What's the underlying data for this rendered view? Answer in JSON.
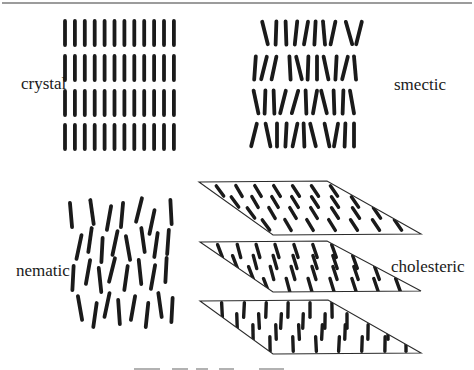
{
  "page": {
    "background": "#ffffff",
    "top_rule_color": "#9c9c9c"
  },
  "labels": {
    "crystal": "crystal",
    "smectic": "smectic",
    "nematic": "nematic",
    "cholesteric": "cholesteric"
  },
  "diagram": {
    "rod_color": "#1a1a1a",
    "plane_stroke_color": "#2b2b2b",
    "crystal": {
      "cols": 12,
      "x_start": 65,
      "x_step": 9.9,
      "row_centers": [
        33,
        68,
        103,
        137
      ],
      "rod_length": 28,
      "rod_width": 3.8
    },
    "smectic": {
      "rod_length": 27,
      "rod_width": 3.8,
      "rods": [
        [
          265,
          33,
          -14
        ],
        [
          276,
          33,
          2
        ],
        [
          286,
          33,
          -2
        ],
        [
          296,
          33,
          6
        ],
        [
          306,
          33,
          10
        ],
        [
          315,
          33,
          3
        ],
        [
          324,
          33,
          -5
        ],
        [
          333,
          33,
          12
        ],
        [
          349,
          33,
          -16
        ],
        [
          359,
          33,
          14
        ],
        [
          255,
          68,
          4
        ],
        [
          264,
          68,
          14
        ],
        [
          274,
          68,
          12
        ],
        [
          290,
          68,
          -3
        ],
        [
          299,
          68,
          -14
        ],
        [
          308,
          68,
          2
        ],
        [
          317,
          68,
          0
        ],
        [
          326,
          68,
          -12
        ],
        [
          336,
          68,
          3
        ],
        [
          345,
          68,
          14
        ],
        [
          355,
          68,
          -5
        ],
        [
          256,
          102,
          -12
        ],
        [
          265,
          102,
          2
        ],
        [
          274,
          102,
          -2
        ],
        [
          283,
          102,
          14
        ],
        [
          295,
          102,
          16
        ],
        [
          306,
          102,
          -2
        ],
        [
          315,
          102,
          10
        ],
        [
          324,
          102,
          -14
        ],
        [
          334,
          102,
          -2
        ],
        [
          343,
          102,
          2
        ],
        [
          352,
          102,
          -10
        ],
        [
          254,
          135,
          14
        ],
        [
          268,
          135,
          -12
        ],
        [
          277,
          135,
          0
        ],
        [
          286,
          135,
          3
        ],
        [
          295,
          135,
          12
        ],
        [
          304,
          135,
          -2
        ],
        [
          313,
          135,
          -14
        ],
        [
          327,
          135,
          -12
        ],
        [
          336,
          135,
          10
        ],
        [
          345,
          135,
          2
        ],
        [
          354,
          135,
          0
        ]
      ]
    },
    "nematic": {
      "rod_length": 28,
      "rod_width": 3.8,
      "rods": [
        [
          71,
          215,
          -5
        ],
        [
          92,
          212,
          -8
        ],
        [
          109,
          218,
          10
        ],
        [
          122,
          215,
          5
        ],
        [
          139,
          210,
          14
        ],
        [
          152,
          222,
          12
        ],
        [
          171,
          212,
          -3
        ],
        [
          79,
          247,
          12
        ],
        [
          90,
          240,
          8
        ],
        [
          102,
          250,
          3
        ],
        [
          115,
          243,
          12
        ],
        [
          128,
          248,
          -10
        ],
        [
          143,
          240,
          -8
        ],
        [
          156,
          245,
          8
        ],
        [
          168,
          242,
          4
        ],
        [
          73,
          278,
          3
        ],
        [
          88,
          272,
          10
        ],
        [
          100,
          280,
          -6
        ],
        [
          112,
          270,
          14
        ],
        [
          126,
          278,
          8
        ],
        [
          140,
          272,
          -6
        ],
        [
          153,
          277,
          10
        ],
        [
          166,
          270,
          3
        ],
        [
          80,
          308,
          -10
        ],
        [
          95,
          315,
          8
        ],
        [
          107,
          305,
          12
        ],
        [
          119,
          312,
          -4
        ],
        [
          133,
          308,
          10
        ],
        [
          147,
          315,
          6
        ],
        [
          160,
          305,
          -8
        ],
        [
          172,
          310,
          3
        ]
      ]
    },
    "cholesteric": {
      "rod_width": 3.4,
      "planes": [
        {
          "angle": -33,
          "rod_length": 16,
          "polygon": [
            [
              199,
              182
            ],
            [
              327,
              181
            ],
            [
              421,
              234
            ],
            [
              273,
              235
            ]
          ],
          "rods": [
            [
              220,
              191
            ],
            [
              239,
              191
            ],
            [
              258,
              191
            ],
            [
              277,
              191
            ],
            [
              296,
              191
            ],
            [
              315,
              191
            ],
            [
              334,
              191
            ],
            [
              235,
              202
            ],
            [
              255,
              202
            ],
            [
              275,
              202
            ],
            [
              295,
              202
            ],
            [
              315,
              202
            ],
            [
              335,
              202
            ],
            [
              355,
              202
            ],
            [
              251,
              213
            ],
            [
              272,
              213
            ],
            [
              293,
              213
            ],
            [
              314,
              213
            ],
            [
              335,
              213
            ],
            [
              356,
              213
            ],
            [
              377,
              213
            ],
            [
              266,
              225
            ],
            [
              288,
              225
            ],
            [
              310,
              225
            ],
            [
              332,
              225
            ],
            [
              354,
              225
            ],
            [
              376,
              225
            ],
            [
              398,
              225
            ]
          ]
        },
        {
          "angle": -18,
          "rod_length": 17,
          "polygon": [
            [
              200,
              242
            ],
            [
              327,
              241
            ],
            [
              421,
              291
            ],
            [
              273,
              292
            ]
          ],
          "rods": [
            [
              220,
              251
            ],
            [
              239,
              251
            ],
            [
              258,
              251
            ],
            [
              277,
              251
            ],
            [
              296,
              251
            ],
            [
              315,
              251
            ],
            [
              334,
              251
            ],
            [
              235,
              262
            ],
            [
              255,
              262
            ],
            [
              275,
              262
            ],
            [
              295,
              262
            ],
            [
              315,
              262
            ],
            [
              335,
              262
            ],
            [
              355,
              262
            ],
            [
              251,
              273
            ],
            [
              272,
              273
            ],
            [
              293,
              273
            ],
            [
              314,
              273
            ],
            [
              335,
              273
            ],
            [
              356,
              273
            ],
            [
              377,
              273
            ],
            [
              266,
              285
            ],
            [
              288,
              285
            ],
            [
              310,
              285
            ],
            [
              332,
              285
            ],
            [
              354,
              285
            ],
            [
              376,
              285
            ],
            [
              398,
              285
            ]
          ]
        },
        {
          "angle": 0,
          "rod_length": 18,
          "polygon": [
            [
              200,
              301
            ],
            [
              328,
              300
            ],
            [
              421,
              353
            ],
            [
              273,
              354
            ]
          ],
          "rods": [
            [
              222,
              310
            ],
            [
              244,
              310
            ],
            [
              266,
              310
            ],
            [
              288,
              310
            ],
            [
              310,
              310
            ],
            [
              332,
              310
            ],
            [
              237,
              321
            ],
            [
              259,
              321
            ],
            [
              281,
              321
            ],
            [
              303,
              321
            ],
            [
              325,
              321
            ],
            [
              347,
              321
            ],
            [
              253,
              332
            ],
            [
              276,
              332
            ],
            [
              299,
              332
            ],
            [
              322,
              332
            ],
            [
              345,
              332
            ],
            [
              368,
              332
            ],
            [
              388,
              332
            ],
            [
              270,
              344
            ],
            [
              293,
              344
            ],
            [
              316,
              344
            ],
            [
              339,
              344
            ],
            [
              362,
              344
            ],
            [
              385,
              344
            ],
            [
              406,
              344
            ]
          ]
        }
      ]
    },
    "caption_fragments": {
      "color": "#b2b2b2",
      "rects": [
        [
          134,
          368,
          26,
          2
        ],
        [
          172,
          368,
          16,
          2
        ],
        [
          196,
          368,
          12,
          2
        ],
        [
          219,
          368,
          15,
          2
        ],
        [
          259,
          368,
          25,
          2
        ]
      ]
    }
  }
}
